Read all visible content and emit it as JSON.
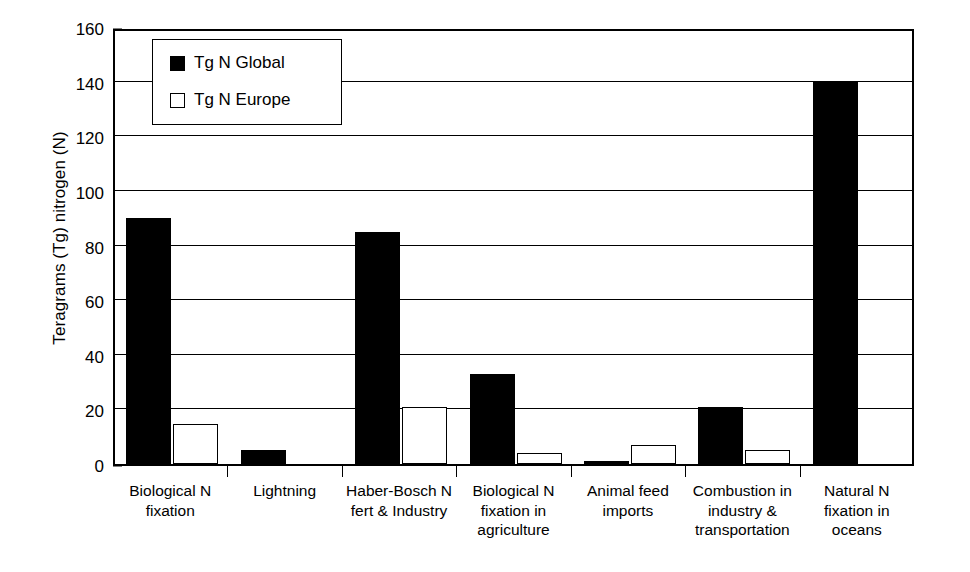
{
  "chart_data": {
    "type": "bar",
    "title": "",
    "subtitle": "",
    "xlabel": "",
    "ylabel": "Teragrams (Tg) nitrogen (N)",
    "ylim": [
      0,
      160
    ],
    "ytick_step": 20,
    "y_minor_step": 5,
    "yticks": [
      0,
      20,
      40,
      60,
      80,
      100,
      120,
      140,
      160
    ],
    "grid": "horizontal",
    "legend_position": "top-left-inside",
    "categories": [
      "Biological N\nfixation",
      "Lightning",
      "Haber-Bosch N\nfert & Industry",
      "Biological N\nfixation in\nagriculture",
      "Animal feed\nimports",
      "Combustion in\nindustry &\ntransportation",
      "Natural N\nfixation in\noceans"
    ],
    "series": [
      {
        "name": "Tg N Global",
        "color": "#000000",
        "style": "filled",
        "values": [
          90,
          5,
          85,
          33,
          1,
          21,
          140
        ]
      },
      {
        "name": "Tg N Europe",
        "color": "#ffffff",
        "style": "open",
        "values": [
          14.5,
          0,
          21,
          4,
          7,
          5,
          0
        ]
      }
    ]
  },
  "legend": {
    "items": [
      {
        "label": "Tg N Global",
        "swatch": "filled-square-icon"
      },
      {
        "label": "Tg N Europe",
        "swatch": "open-square-icon"
      }
    ]
  },
  "colors": {
    "global": "#000000",
    "europe": "#ffffff",
    "axis": "#000000",
    "background": "#ffffff"
  }
}
